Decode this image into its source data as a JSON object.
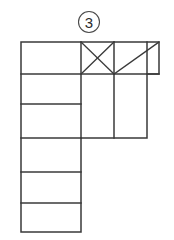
{
  "figure": {
    "label": "3",
    "label_style": "circled-number",
    "caption": "",
    "background_color": "#ffffff",
    "line_color": "#3a3a3a",
    "face_fill": "#ffffff",
    "label_circle": {
      "cx": 89,
      "cy": 22,
      "r": 10.5,
      "stroke_color": "#4a4a4a"
    }
  },
  "geometry": {
    "units": "px",
    "grid": {
      "columns_x": [
        21,
        81,
        114,
        147,
        159
      ],
      "rows_y": [
        42,
        74,
        104,
        138,
        172,
        203,
        232
      ]
    },
    "outline_path": "M21,42 L159,42 L159,74 L147,74 L147,138 L81,138 L81,232 L21,232 Z",
    "faces": [
      {
        "id": "face-left-1",
        "name": "left-column-row-1",
        "x": 21,
        "y": 42,
        "w": 60,
        "h": 32,
        "marking": "none"
      },
      {
        "id": "face-left-2",
        "name": "left-column-row-2",
        "x": 21,
        "y": 74,
        "w": 60,
        "h": 30,
        "marking": "none"
      },
      {
        "id": "face-left-3",
        "name": "left-column-row-3",
        "x": 21,
        "y": 104,
        "w": 60,
        "h": 34,
        "marking": "none"
      },
      {
        "id": "face-left-4",
        "name": "left-column-row-4",
        "x": 21,
        "y": 138,
        "w": 60,
        "h": 34,
        "marking": "none"
      },
      {
        "id": "face-left-5",
        "name": "left-column-row-5",
        "x": 21,
        "y": 172,
        "w": 60,
        "h": 31,
        "marking": "none"
      },
      {
        "id": "face-left-6",
        "name": "left-column-row-6",
        "x": 21,
        "y": 203,
        "w": 60,
        "h": 29,
        "marking": "none"
      },
      {
        "id": "face-mid-top",
        "name": "middle-column-top",
        "x": 81,
        "y": 42,
        "w": 33,
        "h": 32,
        "marking": "cross"
      },
      {
        "id": "face-mid-bottom",
        "name": "middle-column-bottom",
        "x": 81,
        "y": 74,
        "w": 33,
        "h": 64,
        "marking": "none"
      },
      {
        "id": "face-right-top",
        "name": "right-column-top",
        "x": 114,
        "y": 42,
        "w": 45,
        "h": 32,
        "marking": "diagonal-up"
      },
      {
        "id": "face-right-bottom",
        "name": "right-column-bottom",
        "x": 114,
        "y": 74,
        "w": 33,
        "h": 64,
        "marking": "none"
      }
    ],
    "interior_lines": [
      {
        "id": "h-74-left",
        "x1": 21,
        "y1": 74,
        "x2": 114,
        "y2": 74
      },
      {
        "id": "h-74-right",
        "x1": 114,
        "y1": 74,
        "x2": 159,
        "y2": 74
      },
      {
        "id": "h-104",
        "x1": 21,
        "y1": 104,
        "x2": 81,
        "y2": 104
      },
      {
        "id": "h-138",
        "x1": 21,
        "y1": 138,
        "x2": 81,
        "y2": 138
      },
      {
        "id": "h-172",
        "x1": 21,
        "y1": 172,
        "x2": 81,
        "y2": 172
      },
      {
        "id": "h-203",
        "x1": 21,
        "y1": 203,
        "x2": 81,
        "y2": 203
      },
      {
        "id": "v-81-top",
        "x1": 81,
        "y1": 42,
        "x2": 81,
        "y2": 138
      },
      {
        "id": "v-114",
        "x1": 114,
        "y1": 42,
        "x2": 114,
        "y2": 138
      },
      {
        "id": "v-147",
        "x1": 147,
        "y1": 42,
        "x2": 147,
        "y2": 74
      }
    ],
    "diagonals": [
      {
        "id": "d-cross-a",
        "x1": 81,
        "y1": 42,
        "x2": 114,
        "y2": 74
      },
      {
        "id": "d-cross-b",
        "x1": 114,
        "y1": 42,
        "x2": 81,
        "y2": 74
      },
      {
        "id": "d-right",
        "x1": 114,
        "y1": 74,
        "x2": 159,
        "y2": 42
      }
    ]
  }
}
